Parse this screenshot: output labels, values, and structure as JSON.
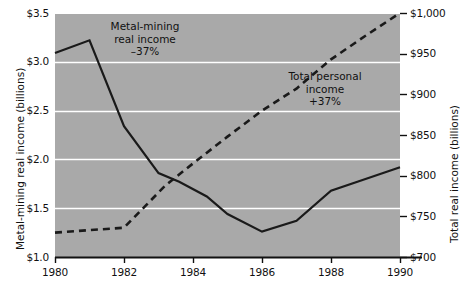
{
  "chart_data": {
    "type": "line",
    "title": "",
    "subtitle": "",
    "xlabel": "",
    "x": [
      1980,
      1981,
      1982,
      1983,
      1984,
      1985,
      1986,
      1987,
      1988,
      1989,
      1990
    ],
    "xlim": [
      1980,
      1990
    ],
    "xticks": [
      1980,
      1982,
      1984,
      1986,
      1988,
      1990
    ],
    "xtick_labels": [
      "1980",
      "1982",
      "1984",
      "1986",
      "1988",
      "1990"
    ],
    "grid": true,
    "grid_color": "#ffffff",
    "plot_background": "#a9a9a9",
    "legend": "none (inline annotations)",
    "axes": [
      {
        "side": "left",
        "label": "Metal-mining real income (billions)",
        "ylim": [
          1.0,
          3.5
        ],
        "yticks": [
          1.0,
          1.5,
          2.0,
          2.5,
          3.0,
          3.5
        ],
        "ytick_labels": [
          "$1.0",
          "$1.5",
          "$2.0",
          "$2.5",
          "$3.0",
          "$3.5"
        ]
      },
      {
        "side": "right",
        "label": "Total real income (billions)",
        "ylim": [
          700,
          1000
        ],
        "yticks": [
          700,
          750,
          800,
          850,
          900,
          950,
          1000
        ],
        "ytick_labels": [
          "$700",
          "$750",
          "$800",
          "$850",
          "$900",
          "$950",
          "$1,000"
        ]
      }
    ],
    "series": [
      {
        "name": "Metal-mining real income",
        "axis": "left",
        "style": "solid",
        "color": "#1a1a1a",
        "values": [
          3.09,
          3.22,
          2.34,
          1.86,
          1.77,
          1.62,
          1.44,
          1.26,
          1.37,
          1.68,
          1.8,
          1.92
        ],
        "x_values": [
          1980,
          1981,
          1982,
          1983,
          1983.6,
          1984.4,
          1985,
          1986,
          1987,
          1988,
          1989,
          1990
        ],
        "annotation": "Metal-mining\nreal income\n–37%"
      },
      {
        "name": "Total personal income",
        "axis": "right",
        "style": "dashed",
        "color": "#1a1a1a",
        "values": [
          730,
          733,
          736,
          762,
          788,
          815,
          848,
          880,
          907,
          943,
          972,
          1000
        ],
        "x_values": [
          1980,
          1981,
          1982,
          1982.6,
          1983.2,
          1984,
          1985,
          1986,
          1987,
          1988,
          1989,
          1990
        ],
        "annotation": "Total personal\nincome\n+37%"
      }
    ],
    "annotations": [
      {
        "id": "metal-mining",
        "line1": "Metal-mining",
        "line2": "real income",
        "line3": "–37%"
      },
      {
        "id": "total-personal",
        "line1": "Total personal",
        "line2": "income",
        "line3": "+37%"
      }
    ]
  },
  "axis_left": {
    "title": "Metal-mining real income (billions)",
    "ticks": [
      "$3.5",
      "$3.0",
      "$2.5",
      "$2.0",
      "$1.5",
      "$1.0"
    ]
  },
  "axis_right": {
    "title": "Total real income (billions)",
    "ticks": [
      "$1,000",
      "$950",
      "$900",
      "$850",
      "$800",
      "$750",
      "$700"
    ]
  },
  "axis_x": {
    "ticks": [
      "1980",
      "1982",
      "1984",
      "1986",
      "1988",
      "1990"
    ]
  },
  "annotation_metal": {
    "line1": "Metal-mining",
    "line2": "real income",
    "line3": "–37%"
  },
  "annotation_total": {
    "line1": "Total personal",
    "line2": "income",
    "line3": "+37%"
  }
}
